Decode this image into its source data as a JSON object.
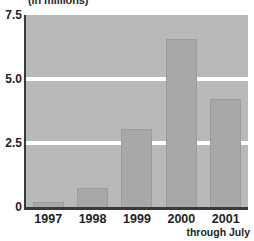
{
  "chart_data": {
    "type": "bar",
    "title": "(in millions)",
    "subtitle": "",
    "xlabel": "",
    "ylabel": "",
    "categories": [
      "1997",
      "1998",
      "1999",
      "2000",
      "2001"
    ],
    "values": [
      0.2,
      0.75,
      3.05,
      6.55,
      4.2
    ],
    "ylim": [
      0,
      7.5
    ],
    "yticks": [
      "0",
      "2.5",
      "5.0",
      "7.5"
    ],
    "ytick_values": [
      0,
      2.5,
      5.0,
      7.5
    ],
    "gridlines": [
      2.5,
      5.0
    ],
    "grid": true,
    "legend": "none",
    "annotations": [
      "through July"
    ],
    "colors": {
      "bar": "#a8a8a8",
      "bar_edge": "#9b9b9b",
      "plot_background": "#b9b9b9",
      "gridline": "#ffffff",
      "axis": "#3a3a3a",
      "text": "#1f1f1f",
      "page_background": "#ffffff"
    }
  },
  "axis": {
    "y_tick_0": "0",
    "y_tick_1": "2.5",
    "y_tick_2": "5.0",
    "y_tick_3": "7.5"
  },
  "footnote": {
    "text": "through July"
  }
}
